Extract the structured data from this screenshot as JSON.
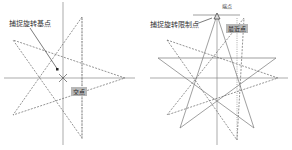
{
  "left_panel": {
    "callout_label": "捕捉旋转基点",
    "snap_tag": "交点",
    "axes": {
      "center": [
        63,
        78
      ]
    },
    "star_points": [
      [
        82,
        17
      ],
      [
        13,
        40
      ],
      [
        125,
        78
      ],
      [
        13,
        115
      ],
      [
        82,
        138
      ]
    ]
  },
  "right_panel": {
    "callout_label": "捕捉旋转限制点",
    "snap_tag": "最近点",
    "top_marker": "端点",
    "axes": {
      "center": [
        217,
        78
      ]
    }
  },
  "colors": {
    "line": "#777777",
    "dashed": "#666666",
    "tag_bg": "#b8b8b8"
  }
}
